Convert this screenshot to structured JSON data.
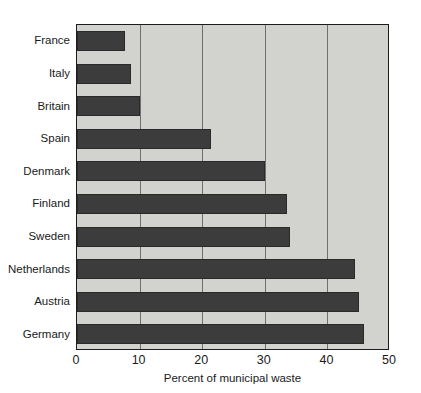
{
  "chart_data": {
    "type": "bar",
    "orientation": "horizontal",
    "title": "",
    "xlabel": "Percent of municipal waste",
    "ylabel": "",
    "categories": [
      "France",
      "Italy",
      "Britain",
      "Spain",
      "Denmark",
      "Finland",
      "Sweden",
      "Netherlands",
      "Austria",
      "Germany"
    ],
    "values": [
      7.6,
      8.7,
      10,
      21.4,
      30,
      33.5,
      34,
      44.4,
      45,
      45.8
    ],
    "xlim": [
      0,
      50
    ],
    "xticks": [
      0,
      10,
      20,
      30,
      40,
      50
    ],
    "xtick_labels": [
      "0",
      "10",
      "20",
      "30",
      "40",
      "50"
    ],
    "grid": "vertical",
    "legend": "none",
    "bar_color": "#3c3c3c",
    "plot_background": "#d2d2cf",
    "gridline_color": "#6f6f6f",
    "axis_color": "#1c1c1c",
    "figure_background": "#ffffff"
  },
  "axis": {
    "x_title": "Percent of municipal waste"
  }
}
